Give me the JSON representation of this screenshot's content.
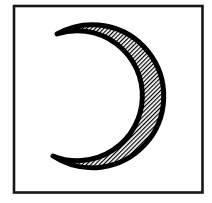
{
  "figure": {
    "type": "diagram",
    "canvas": {
      "width": 212,
      "height": 203,
      "background": "#ffffff"
    },
    "frame": {
      "x": 14,
      "y": 6,
      "width": 188.5,
      "height": 186.5,
      "stroke_color": "#161616",
      "stroke_width": 2.6,
      "fill": "#ffffff"
    },
    "crescent": {
      "opening_direction": "left",
      "path": "M 57 34 A 71.5 71.5 0 1 1 53 156 A 65 65 0 1 0 57 34 Z",
      "outline_color": "#000000",
      "outline_width": 5,
      "fill_style": "diagonal-hatch"
    },
    "hatch": {
      "orientation_deg": -45,
      "period": 3,
      "line_width": 1.2,
      "line_color": "#000000",
      "gap_color": "#ffffff"
    }
  }
}
